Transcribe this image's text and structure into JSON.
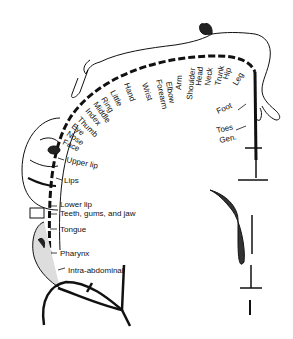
{
  "diagram": {
    "labels": {
      "leg": "Leg",
      "hip": "Hip",
      "trunk": "Trunk",
      "neck": "Neck",
      "head": "Head",
      "shoulder": "Shoulder",
      "arm": "Arm",
      "elbow": "Elbow",
      "forearm": "Forearm",
      "wrist": "Wrist",
      "hand": "Hand",
      "little": "Little",
      "ring": "Ring",
      "middle": "Middle",
      "index": "Index",
      "thumb": "Thumb",
      "eye": "Eye",
      "nose": "Nose",
      "face": "Face",
      "upper_lip": "Upper lip",
      "lips": "Lips",
      "lower_lip": "Lower lip",
      "teeth": "Teeth, gums, and jaw",
      "tongue": "Tongue",
      "pharynx": "Pharynx",
      "intra_abdominal": "Intra-abdominal",
      "foot": "Foot",
      "toes": "Toes",
      "gen": "Gen."
    },
    "colors": {
      "ink": "#111111",
      "background": "#ffffff"
    }
  }
}
